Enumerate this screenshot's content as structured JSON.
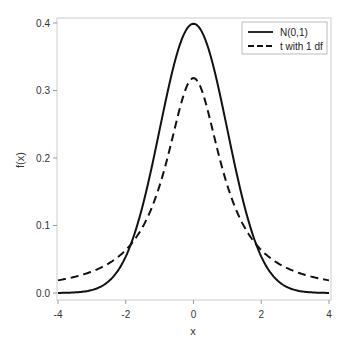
{
  "chart_data": {
    "type": "line",
    "title": "",
    "xlabel": "x",
    "ylabel": "f(x)",
    "xlim": [
      -4,
      4
    ],
    "ylim": [
      0,
      0.4
    ],
    "xticks": [
      -4,
      -2,
      0,
      2,
      4
    ],
    "xtick_labels": [
      "-4",
      "-2",
      "0",
      "2",
      "4"
    ],
    "yticks": [
      0.0,
      0.1,
      0.2,
      0.3,
      0.4
    ],
    "ytick_labels": [
      "0.0",
      "0.1",
      "0.2",
      "0.3",
      "0.4"
    ],
    "grid": false,
    "legend_position": "top-right",
    "series": [
      {
        "name": "N(0,1)",
        "style": "solid",
        "color": "#111111",
        "x": [
          -4,
          -3.5,
          -3,
          -2.5,
          -2,
          -1.5,
          -1,
          -0.5,
          0,
          0.5,
          1,
          1.5,
          2,
          2.5,
          3,
          3.5,
          4
        ],
        "values": [
          0.0001,
          0.0009,
          0.0044,
          0.0175,
          0.054,
          0.1295,
          0.242,
          0.3521,
          0.3989,
          0.3521,
          0.242,
          0.1295,
          0.054,
          0.0175,
          0.0044,
          0.0009,
          0.0001
        ]
      },
      {
        "name": "t with 1 df",
        "style": "dashed",
        "color": "#111111",
        "x": [
          -4,
          -3.5,
          -3,
          -2.5,
          -2,
          -1.5,
          -1,
          -0.5,
          0,
          0.5,
          1,
          1.5,
          2,
          2.5,
          3,
          3.5,
          4
        ],
        "values": [
          0.0187,
          0.024,
          0.0318,
          0.0439,
          0.0637,
          0.0979,
          0.1592,
          0.2546,
          0.3183,
          0.2546,
          0.1592,
          0.0979,
          0.0637,
          0.0439,
          0.0318,
          0.024,
          0.0187
        ]
      }
    ]
  },
  "legend": {
    "items": [
      {
        "label": "N(0,1)",
        "style": "solid"
      },
      {
        "label": "t with 1 df",
        "style": "dashed"
      }
    ]
  },
  "axes": {
    "x_title": "x",
    "y_title": "f(x)",
    "frame_color": "#cccccc",
    "text_color": "#333333"
  }
}
